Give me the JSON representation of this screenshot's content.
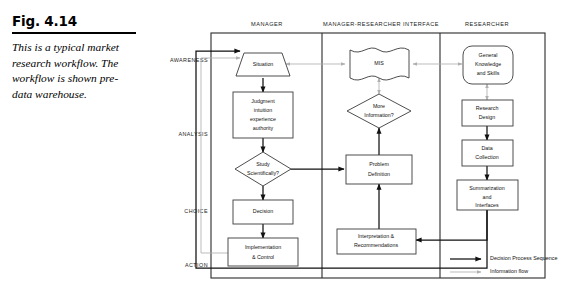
{
  "caption": {
    "figure_label": "Fig. 4.14",
    "text": "This is a typical market research workflow. The workflow is shown pre-data warehouse."
  },
  "columns": [
    {
      "label": "MANAGER"
    },
    {
      "label": "MANAGER-RESEARCHER INTERFACE"
    },
    {
      "label": "RESEARCHER"
    }
  ],
  "stages": [
    {
      "label": "AWARENESS"
    },
    {
      "label": "ANALYSIS"
    },
    {
      "label": "CHOICE"
    },
    {
      "label": "ACTION"
    }
  ],
  "nodes": {
    "situation": {
      "label": "Situation",
      "shape": "trapezoid"
    },
    "judgment": {
      "line1": "Judgment",
      "line2": "intuition",
      "line3": "experience",
      "line4": "authority",
      "shape": "rectangle"
    },
    "study_scientifically": {
      "line1": "Study",
      "line2": "Scientifically?",
      "shape": "diamond"
    },
    "decision": {
      "label": "Decision",
      "shape": "rectangle"
    },
    "implementation": {
      "line1": "Implementation",
      "line2": "& Control",
      "shape": "rectangle"
    },
    "mis": {
      "label": "MIS",
      "shape": "document"
    },
    "more_information": {
      "line1": "More",
      "line2": "Information?",
      "shape": "diamond"
    },
    "problem_definition": {
      "line1": "Problem",
      "line2": "Definition",
      "shape": "rectangle"
    },
    "interpretation": {
      "line1": "Interpretation &",
      "line2": "Recommendations",
      "shape": "rectangle"
    },
    "general_knowledge": {
      "line1": "General",
      "line2": "Knowledge",
      "line3": "and Skills",
      "shape": "rounded"
    },
    "research_design": {
      "line1": "Research",
      "line2": "Design",
      "shape": "rectangle"
    },
    "data_collection": {
      "line1": "Data",
      "line2": "Collection",
      "shape": "rectangle"
    },
    "summarization": {
      "line1": "Summarization",
      "line2": "and",
      "line3": "Interfaces",
      "shape": "rectangle"
    }
  },
  "legend": [
    {
      "label": "Decision Process Sequence",
      "style": "solid-black-thick"
    },
    {
      "label": "Information flow",
      "style": "solid-gray-thin"
    }
  ],
  "colors": {
    "decision_sequence": "#111111",
    "information_flow": "#b0b0b0",
    "node_stroke": "#3a3a3a",
    "frame_stroke": "#2a2a2a",
    "background": "#ffffff"
  }
}
